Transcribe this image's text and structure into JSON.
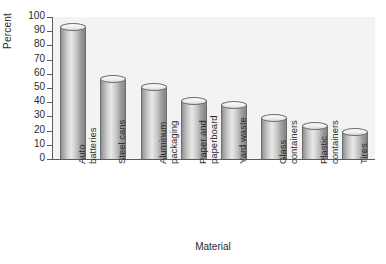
{
  "chart_data": {
    "type": "bar",
    "title": "",
    "xlabel": "Material",
    "ylabel": "Percent",
    "categories": [
      "Auto\nbatteries",
      "Steel cans",
      "Aluminum\npackaging",
      "Paper and\npaperboard",
      "Yard waste",
      "Glass\ncontainers",
      "Plastic\ncontainers",
      "Tires"
    ],
    "values": [
      93,
      56,
      51,
      41,
      38,
      29,
      23,
      19
    ],
    "ylim": [
      0,
      100
    ],
    "yticks": [
      0,
      10,
      20,
      30,
      40,
      50,
      60,
      70,
      80,
      90,
      100
    ],
    "grid": false,
    "legend": false,
    "bar_style": "3d-cylinder",
    "colors": {
      "bar_fill": "#c9c9c9",
      "bar_edge": "#6e6e6e",
      "axis": "#5a5a5a",
      "plot_background": "#f3f3f3",
      "text": "#2b2b2b"
    }
  }
}
